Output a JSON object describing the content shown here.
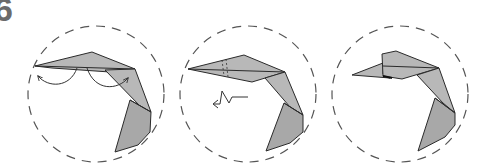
{
  "step": {
    "number": "6"
  },
  "colors": {
    "paper": "#b8b8b8",
    "paper_dark": "#a8a8a8",
    "outline": "#2a2a2a",
    "circle": "#555555",
    "background": "#ffffff"
  },
  "panels": [
    {
      "id": "panel-1",
      "description": "Crane head/neck with two curved arrows indicating reverse folds",
      "arrows": [
        "curved-arrow-left",
        "curved-arrow-right"
      ]
    },
    {
      "id": "panel-2",
      "description": "Head with dashed crease lines and pleat (zigzag) arrow pointing left",
      "arrows": [
        "pleat-arrow-left"
      ]
    },
    {
      "id": "panel-3",
      "description": "Result: head shaped with folded crest"
    }
  ]
}
